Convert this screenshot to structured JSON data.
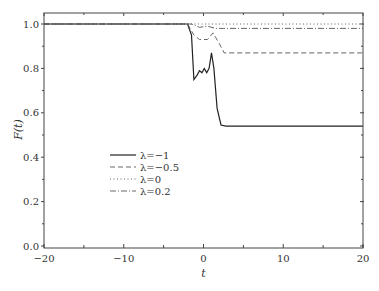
{
  "chart_data": {
    "type": "line",
    "title": "",
    "xlabel": "t",
    "ylabel": "F(t)",
    "xlim": [
      -20,
      20
    ],
    "ylim": [
      0.0,
      1.05
    ],
    "xticks": [
      -20,
      -10,
      0,
      10,
      20
    ],
    "xtick_labels": [
      "−20",
      "−10",
      "0",
      "10",
      "20"
    ],
    "yticks": [
      0.0,
      0.2,
      0.4,
      0.6,
      0.8,
      1.0
    ],
    "ytick_labels": [
      "0.0",
      "0.2",
      "0.4",
      "0.6",
      "0.8",
      "1.0"
    ],
    "grid": false,
    "legend_position": "lower-left (inside)",
    "series": [
      {
        "name": "λ=−1",
        "style": "solid",
        "x": [
          -20,
          -2,
          -1.5,
          -1.2,
          -0.8,
          -0.5,
          -0.2,
          0.1,
          0.4,
          0.7,
          1.0,
          1.3,
          1.7,
          2.2,
          2.8,
          20
        ],
        "y": [
          1.0,
          1.0,
          0.95,
          0.75,
          0.77,
          0.79,
          0.78,
          0.8,
          0.78,
          0.8,
          0.87,
          0.8,
          0.62,
          0.545,
          0.54,
          0.54
        ]
      },
      {
        "name": "λ=−0.5",
        "style": "dashed",
        "x": [
          -20,
          -2,
          -1.2,
          -0.5,
          0.5,
          1.2,
          2.0,
          2.6,
          20
        ],
        "y": [
          1.0,
          1.0,
          0.95,
          0.93,
          0.93,
          0.96,
          0.91,
          0.87,
          0.87
        ]
      },
      {
        "name": "λ=0",
        "style": "dotted",
        "x": [
          -20,
          20
        ],
        "y": [
          1.0,
          1.0
        ]
      },
      {
        "name": "λ=0.2",
        "style": "dashdot",
        "x": [
          -20,
          -1.5,
          -0.5,
          0.5,
          1.5,
          2.5,
          20
        ],
        "y": [
          1.0,
          1.0,
          0.985,
          0.99,
          0.98,
          0.98,
          0.98
        ]
      }
    ]
  }
}
